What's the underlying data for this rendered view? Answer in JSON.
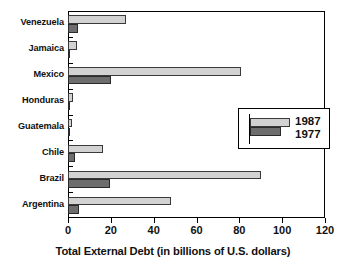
{
  "chart_data": {
    "type": "bar",
    "orientation": "horizontal",
    "title": "Latin American Countries With Foreign Debt (1977 Compared to 1987)",
    "title_lines": [
      "Latin American Countries",
      "With Foreign Debt",
      "(1977 Compared to 1987)"
    ],
    "categories": [
      "Venezuela",
      "Jamaica",
      "Mexico",
      "Honduras",
      "Guatemala",
      "Chile",
      "Brazil",
      "Argentina"
    ],
    "series": [
      {
        "name": "1987",
        "color": "#d2d2d2",
        "values": [
          27,
          4,
          81,
          2.5,
          2,
          16.5,
          90,
          48
        ]
      },
      {
        "name": "1977",
        "color": "#6d6d6d",
        "values": [
          4.5,
          1,
          20,
          0.6,
          0.4,
          3.5,
          19.5,
          5
        ]
      }
    ],
    "xlabel": "Total External Debt (in billions of U.S. dollars)",
    "ylabel": "",
    "xlim": [
      0,
      120
    ],
    "xticks": [
      0,
      20,
      40,
      60,
      80,
      100,
      120
    ],
    "xtick_labels": [
      "0",
      "20",
      "40",
      "60",
      "80",
      "100",
      "120"
    ],
    "grid": false,
    "legend": {
      "position": "middle-right-inside",
      "entries": [
        {
          "label": "1987",
          "color": "#d2d2d2"
        },
        {
          "label": "1977",
          "color": "#6d6d6d"
        }
      ]
    },
    "frame_color": "#000000",
    "background": "#ffffff"
  }
}
